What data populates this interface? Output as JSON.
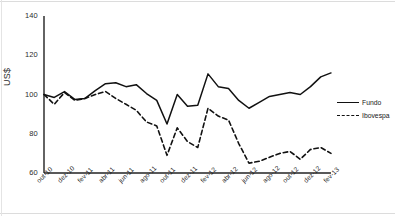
{
  "chart_data": {
    "type": "line",
    "title": "",
    "xlabel": "",
    "ylabel": "US$",
    "ylim": [
      60,
      140
    ],
    "yticks": [
      60,
      80,
      100,
      120,
      140
    ],
    "grid": false,
    "legend_position": "right",
    "x": [
      "out-10",
      "nov-10",
      "dez-10",
      "jan-11",
      "fev-11",
      "mar-11",
      "abr-11",
      "mai-11",
      "jun-11",
      "jul-11",
      "ago-11",
      "set-11",
      "out-11",
      "nov-11",
      "dez-11",
      "jan-12",
      "fev-12",
      "mar-12",
      "abr-12",
      "mai-12",
      "jun-12",
      "jul-12",
      "ago-12",
      "set-12",
      "out-12",
      "nov-12",
      "dez-12",
      "jan-13",
      "fev-13"
    ],
    "xticks": [
      "out-10",
      "dez-10",
      "fev-11",
      "abr-11",
      "jun-11",
      "ago-11",
      "out-11",
      "dez-11",
      "fev-12",
      "abr-12",
      "jun-12",
      "ago-12",
      "out-12",
      "dez-12",
      "fev-13"
    ],
    "series": [
      {
        "name": "Fundo",
        "style": "solid",
        "color": "#111111",
        "values": [
          100,
          98.5,
          101.5,
          97.5,
          98,
          102,
          105.5,
          106,
          104,
          105,
          100.5,
          97,
          85,
          100,
          94,
          94.5,
          110.5,
          104,
          103,
          97,
          93,
          96,
          99,
          100,
          101,
          100,
          104,
          109,
          111
        ]
      },
      {
        "name": "Ibovespa",
        "style": "dashed",
        "color": "#111111",
        "values": [
          100,
          95,
          101,
          97,
          98,
          100,
          101.5,
          98,
          95,
          92,
          86,
          84,
          69,
          83,
          76,
          73,
          93,
          89,
          87,
          75,
          65,
          66,
          68,
          70,
          71,
          67,
          72,
          73,
          70
        ]
      }
    ]
  },
  "legend": {
    "items": [
      {
        "label": "Fundo",
        "style": "solid"
      },
      {
        "label": "Ibovespa",
        "style": "dashed"
      }
    ]
  }
}
